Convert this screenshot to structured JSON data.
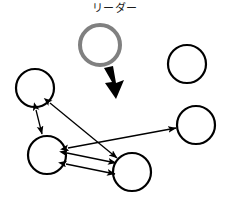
{
  "figure": {
    "title_label": "リーダー",
    "colors": {
      "leader_stroke": "#808080",
      "node_stroke": "#000000",
      "arrow_stroke": "#000000",
      "bold_arrow_fill": "#000000",
      "background": "#ffffff"
    }
  },
  "leader": {
    "label": "リーダー",
    "shape": "circle",
    "cx": 100,
    "cy": 45,
    "r": 20,
    "stroke": "#808080",
    "stroke_width": 4,
    "fill": "none"
  },
  "bold_arrow": {
    "name": "leader-direction-arrow",
    "from_x": 108,
    "from_y": 68,
    "to_x": 118,
    "to_y": 97,
    "fill": "#000000"
  },
  "nodes": [
    {
      "id": "node-upper-left",
      "cx": 35,
      "cy": 88,
      "r": 19,
      "stroke": "#000000",
      "stroke_width": 2.2,
      "fill": "none"
    },
    {
      "id": "node-lower-left",
      "cx": 47,
      "cy": 155,
      "r": 19,
      "stroke": "#000000",
      "stroke_width": 2.2,
      "fill": "none"
    },
    {
      "id": "node-bottom-center",
      "cx": 132,
      "cy": 172,
      "r": 19,
      "stroke": "#000000",
      "stroke_width": 2.2,
      "fill": "none"
    },
    {
      "id": "node-middle-right",
      "cx": 196,
      "cy": 125,
      "r": 19,
      "stroke": "#000000",
      "stroke_width": 2.2,
      "fill": "none"
    },
    {
      "id": "node-top-right",
      "cx": 187,
      "cy": 64,
      "r": 19,
      "stroke": "#000000",
      "stroke_width": 2.2,
      "fill": "none"
    }
  ],
  "connections": [
    {
      "id": "link-upperleft-lowerleft",
      "from": "node-upper-left",
      "to": "node-lower-left",
      "x1": 36,
      "y1": 110,
      "x2": 42,
      "y2": 134,
      "double_headed": true
    },
    {
      "id": "link-upperleft-bottomcenter",
      "from": "node-upper-left",
      "to": "node-bottom-center",
      "x1": 50,
      "y1": 103,
      "x2": 117,
      "y2": 158,
      "double_headed": true
    },
    {
      "id": "link-lowerleft-middleright",
      "from": "node-lower-left",
      "to": "node-middle-right",
      "x1": 68,
      "y1": 148,
      "x2": 176,
      "y2": 128,
      "double_headed": true
    },
    {
      "id": "link-lowerleft-bottomcenter-upper",
      "from": "node-lower-left",
      "to": "node-bottom-center",
      "x1": 67,
      "y1": 153,
      "x2": 116,
      "y2": 163,
      "double_headed": true
    },
    {
      "id": "link-lowerleft-bottomcenter-lower",
      "from": "node-lower-left",
      "to": "node-bottom-center",
      "x1": 66,
      "y1": 164,
      "x2": 115,
      "y2": 174,
      "double_headed": true
    }
  ]
}
